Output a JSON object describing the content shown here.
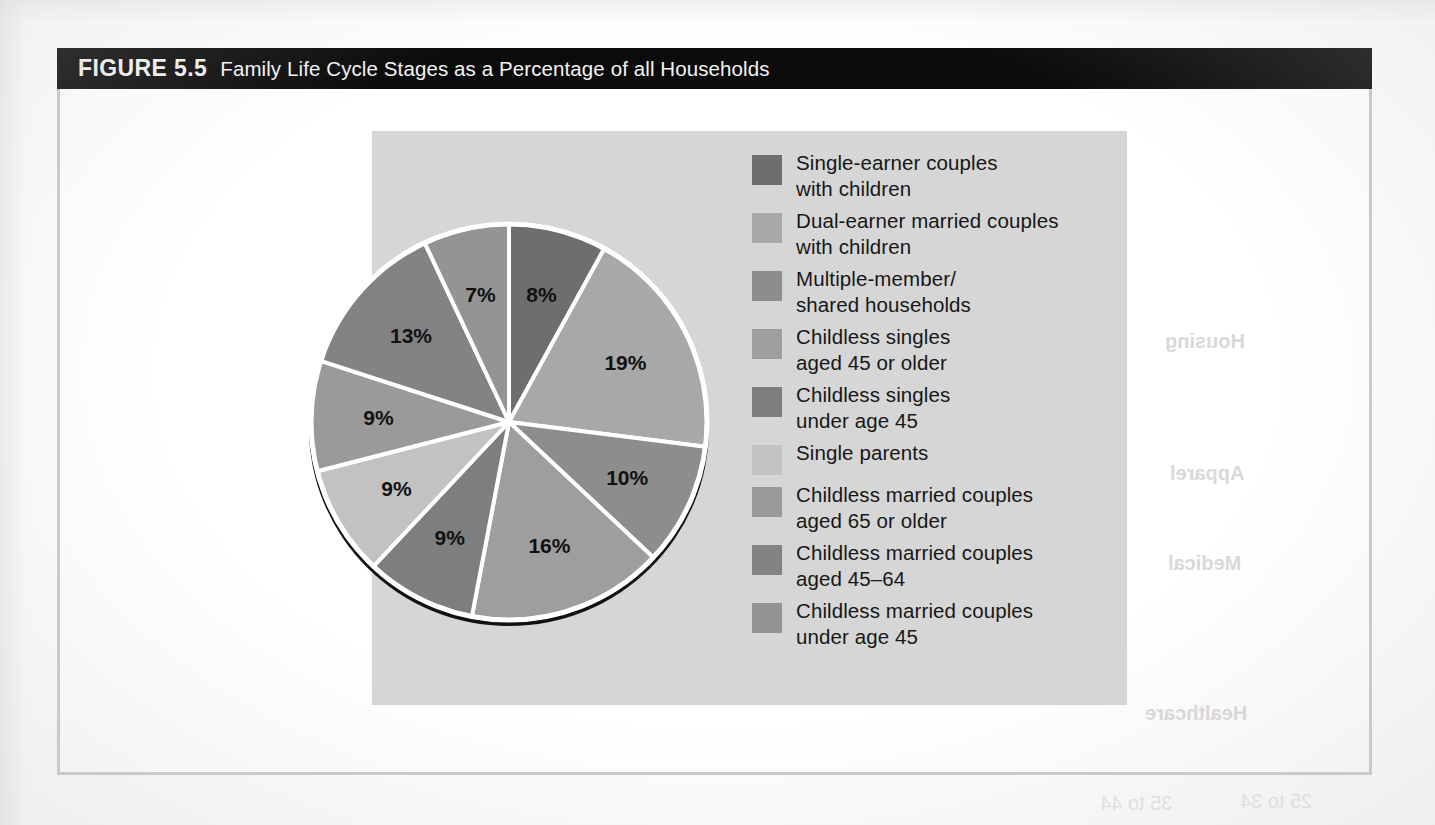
{
  "figure": {
    "number": "FIGURE 5.5",
    "title": "Family Life Cycle Stages as a Percentage of all Households"
  },
  "colors": {
    "caption_bar_bg": "#0b0b0b",
    "caption_text": "#f2f2f2",
    "panel_bg": "#d6d6d6",
    "page_bg": "#ffffff",
    "frame_border": "#c9c9c9",
    "slice_divider": "#ffffff",
    "pie_shadow": "#111111",
    "label_text": "#111111"
  },
  "chart_data": {
    "type": "pie",
    "title": "Family Life Cycle Stages as a Percentage of all Households",
    "xlabel": "",
    "ylabel": "",
    "legend_position": "right",
    "grid": false,
    "start_angle_deg": 0,
    "direction": "clockwise",
    "total": 100,
    "units": "%",
    "categories": [
      "Single-earner couples with children",
      "Dual-earner married couples with children",
      "Multiple-member/ shared households",
      "Childless singles aged 45 or older",
      "Childless singles under age 45",
      "Single parents",
      "Childless married couples aged 65 or older",
      "Childless married couples aged 45–64",
      "Childless married couples under age 45"
    ],
    "values": [
      8,
      19,
      10,
      16,
      9,
      9,
      9,
      13,
      7
    ],
    "labels": [
      "8%",
      "19%",
      "10%",
      "16%",
      "9%",
      "9%",
      "9%",
      "13%",
      "7%"
    ],
    "slice_colors": [
      "#6e6e6e",
      "#a8a8a8",
      "#8d8d8d",
      "#9e9e9e",
      "#7e7e7e",
      "#c2c2c2",
      "#9a9a9a",
      "#838383",
      "#949494"
    ]
  },
  "legend": {
    "items": [
      {
        "label": "Single-earner couples\nwith children",
        "color": "#6e6e6e",
        "value": "8%"
      },
      {
        "label": "Dual-earner married couples\nwith children",
        "color": "#a8a8a8",
        "value": "19%"
      },
      {
        "label": "Multiple-member/\nshared households",
        "color": "#8d8d8d",
        "value": "10%"
      },
      {
        "label": "Childless singles\naged 45 or older",
        "color": "#9e9e9e",
        "value": "16%"
      },
      {
        "label": "Childless singles\nunder age 45",
        "color": "#7e7e7e",
        "value": "9%"
      },
      {
        "label": "Single parents",
        "color": "#c2c2c2",
        "value": "9%"
      },
      {
        "label": "Childless married couples\naged 65 or older",
        "color": "#9a9a9a",
        "value": "9%"
      },
      {
        "label": "Childless married couples\naged 45–64",
        "color": "#838383",
        "value": "13%"
      },
      {
        "label": "Childless married couples\nunder age 45",
        "color": "#949494",
        "value": "7%"
      }
    ]
  },
  "bleed_through": {
    "items": [
      {
        "text": "Housing",
        "x": 1165,
        "y": 330
      },
      {
        "text": "Apparel",
        "x": 1170,
        "y": 462
      },
      {
        "text": "Medical",
        "x": 1168,
        "y": 552
      },
      {
        "text": "Healthcare",
        "x": 1145,
        "y": 702
      },
      {
        "text": "25 to 34",
        "x": 1240,
        "y": 790
      },
      {
        "text": "35 to 44",
        "x": 1100,
        "y": 792
      }
    ]
  }
}
